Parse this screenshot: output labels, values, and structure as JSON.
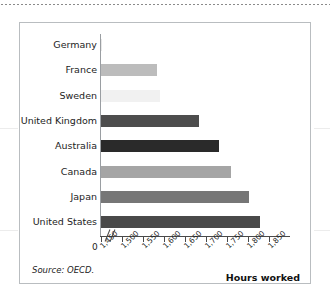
{
  "figure": {
    "source_note": "Source: OECD.",
    "value_axis_title": "Hours worked",
    "origin_label": "0",
    "axis_break_icon": "axis-break-slashes"
  },
  "chart_data": {
    "type": "bar",
    "orientation": "horizontal",
    "title": "",
    "xlabel": "Hours worked",
    "ylabel": "",
    "categories": [
      "Germany",
      "France",
      "Sweden",
      "United Kingdom",
      "Australia",
      "Canada",
      "Japan",
      "United States"
    ],
    "values": [
      1450,
      1582,
      1588,
      1680,
      1728,
      1757,
      1800,
      1825
    ],
    "bar_colors": [
      "#e8e8e8",
      "#bcbcbc",
      "#f1f1f1",
      "#4d4d4d",
      "#2a2a2a",
      "#a5a5a5",
      "#767676",
      "#494949"
    ],
    "xlim": [
      1450,
      1850
    ],
    "axis_break": true,
    "tick_labels": [
      "1,450",
      "1,500",
      "1,550",
      "1,600",
      "1,650",
      "1,700",
      "1,750",
      "1,800",
      "1,850"
    ],
    "tick_values": [
      1450,
      1500,
      1550,
      1600,
      1650,
      1700,
      1750,
      1800,
      1850
    ],
    "grid": false,
    "legend": "none",
    "source": "Source: OECD."
  }
}
